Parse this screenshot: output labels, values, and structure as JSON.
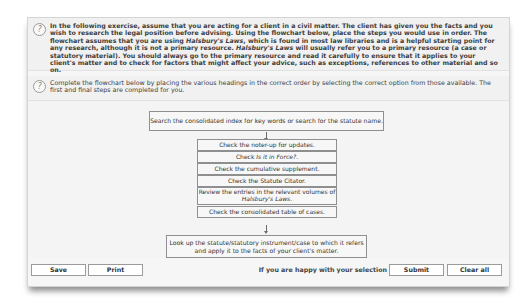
{
  "intro": {
    "icon": "help-icon",
    "text_parts": [
      "In the following exercise, assume that you are acting for a client in a civil matter. The client has given you the facts and you wish to research the legal position before advising. Using the flowchart below, place the steps you would use in order. The flowchart assumes that you are using ",
      "Halsbury's Laws",
      ", which is found in most law libraries and is a helpful starting point for any research, although it is not a primary resource. ",
      "Halsbury's Laws",
      " will usually refer you to a primary resource (a case or statutory material). You should always go to the primary resource and read it carefully to ensure that it applies to your client's matter and to check for factors that might affect your advice, such as exceptions, references to other material and so on."
    ]
  },
  "instructions": {
    "icon": "help-icon",
    "text": "Complete the flowchart below by placing the various headings in the correct order by selecting the correct option from those available. The first and final steps are completed for you."
  },
  "flowchart": {
    "first_step": "Search the consolidated index for key words or search for the statute name.",
    "steps": [
      {
        "pre": "Check the noter-up for updates.",
        "em": "",
        "post": ""
      },
      {
        "pre": "Check ",
        "em": "Is it in Force?",
        "post": "."
      },
      {
        "pre": "Check the cumulative supplement.",
        "em": "",
        "post": ""
      },
      {
        "pre": "Check the Statute Citator.",
        "em": "",
        "post": ""
      },
      {
        "pre": "Review the entries in the relevant volumes of ",
        "em": "Halsbury's Laws",
        "post": "."
      },
      {
        "pre": "Check the consolidated table of cases.",
        "em": "",
        "post": ""
      }
    ],
    "final_step": "Look up the statute/statutory instrument/case to which it refers and apply it to the facts of your client's matter."
  },
  "buttons": {
    "save": "Save",
    "print": "Print",
    "happy_text": "If you are happy with your selection",
    "submit": "Submit",
    "clear_all": "Clear all"
  }
}
